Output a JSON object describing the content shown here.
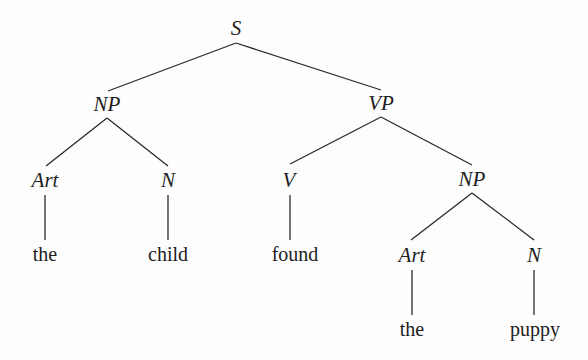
{
  "diagram": {
    "type": "syntax-tree",
    "sentence": "the child found the puppy",
    "nodes": {
      "s": {
        "label": "S",
        "x": 236,
        "y": 28
      },
      "np1": {
        "label": "NP",
        "x": 107,
        "y": 104
      },
      "vp": {
        "label": "VP",
        "x": 381,
        "y": 103
      },
      "art1": {
        "label": "Art",
        "x": 45,
        "y": 180
      },
      "n1": {
        "label": "N",
        "x": 168,
        "y": 180
      },
      "v": {
        "label": "V",
        "x": 289,
        "y": 180
      },
      "np2": {
        "label": "NP",
        "x": 472,
        "y": 179
      },
      "art2": {
        "label": "Art",
        "x": 412,
        "y": 255
      },
      "n2": {
        "label": "N",
        "x": 534,
        "y": 255
      },
      "w_the1": {
        "label": "the",
        "x": 45,
        "y": 254
      },
      "w_child": {
        "label": "child",
        "x": 168,
        "y": 254
      },
      "w_found": {
        "label": "found",
        "x": 295,
        "y": 254
      },
      "w_the2": {
        "label": "the",
        "x": 412,
        "y": 329
      },
      "w_puppy": {
        "label": "puppy",
        "x": 535,
        "y": 329
      }
    },
    "edges": [
      [
        "s",
        "np1"
      ],
      [
        "s",
        "vp"
      ],
      [
        "np1",
        "art1"
      ],
      [
        "np1",
        "n1"
      ],
      [
        "vp",
        "v"
      ],
      [
        "vp",
        "np2"
      ],
      [
        "np2",
        "art2"
      ],
      [
        "np2",
        "n2"
      ],
      [
        "art1",
        "w_the1"
      ],
      [
        "n1",
        "w_child"
      ],
      [
        "v",
        "w_found"
      ],
      [
        "art2",
        "w_the2"
      ],
      [
        "n2",
        "w_puppy"
      ]
    ],
    "line_color": "#2a2a2a"
  }
}
